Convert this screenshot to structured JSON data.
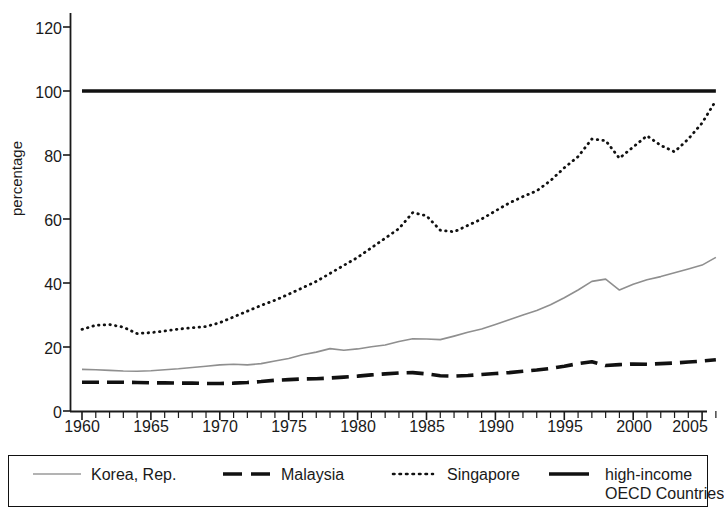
{
  "chart_data": {
    "type": "line",
    "title": "",
    "xlabel": "",
    "ylabel": "percentage",
    "xlim": [
      1960,
      2006
    ],
    "ylim": [
      0,
      120
    ],
    "ytick_values": [
      0,
      20,
      40,
      60,
      80,
      100,
      120
    ],
    "ytick_labels": [
      "0",
      "20",
      "40",
      "60",
      "80",
      "100",
      "120"
    ],
    "xtick_labels": [
      "1960",
      "1965",
      "1970",
      "1975",
      "1980",
      "1985",
      "1990",
      "1995",
      "2000",
      "2005"
    ],
    "xtick_values": [
      1960,
      1965,
      1970,
      1975,
      1980,
      1985,
      1990,
      1995,
      2000,
      2005
    ],
    "minor_xtick_step": 1,
    "grid": false,
    "legend_position": "below-plot",
    "x": [
      1960,
      1961,
      1962,
      1963,
      1964,
      1965,
      1966,
      1967,
      1968,
      1969,
      1970,
      1971,
      1972,
      1973,
      1974,
      1975,
      1976,
      1977,
      1978,
      1979,
      1980,
      1981,
      1982,
      1983,
      1984,
      1985,
      1986,
      1987,
      1988,
      1989,
      1990,
      1991,
      1992,
      1993,
      1994,
      1995,
      1996,
      1997,
      1998,
      1999,
      2000,
      2001,
      2002,
      2003,
      2004,
      2005,
      2006
    ],
    "series": [
      {
        "name": "Korea, Rep.",
        "style": "thin-solid-gray",
        "color": "#8f8f8f",
        "values": [
          13.0,
          12.9,
          12.7,
          12.5,
          12.4,
          12.6,
          12.9,
          13.2,
          13.6,
          14.0,
          14.4,
          14.6,
          14.4,
          14.8,
          15.6,
          16.4,
          17.6,
          18.4,
          19.5,
          19.0,
          19.4,
          20.1,
          20.6,
          21.7,
          22.6,
          22.5,
          22.3,
          23.4,
          24.6,
          25.6,
          27.0,
          28.5,
          30.0,
          31.4,
          33.2,
          35.4,
          37.8,
          40.5,
          41.2,
          37.8,
          39.6,
          41.0,
          42.0,
          43.2,
          44.4,
          45.6,
          48.0
        ]
      },
      {
        "name": "Malaysia",
        "style": "thick-dashed-black",
        "color": "#111111",
        "values": [
          9.0,
          9.0,
          9.0,
          9.0,
          8.9,
          8.8,
          8.8,
          8.7,
          8.7,
          8.6,
          8.6,
          8.7,
          8.9,
          9.2,
          9.6,
          9.8,
          10.0,
          10.1,
          10.3,
          10.6,
          10.9,
          11.3,
          11.6,
          11.9,
          12.0,
          11.6,
          11.0,
          10.9,
          11.1,
          11.4,
          11.7,
          12.0,
          12.4,
          12.8,
          13.3,
          14.0,
          14.8,
          15.4,
          14.2,
          14.5,
          14.7,
          14.6,
          14.8,
          15.0,
          15.3,
          15.6,
          16.0
        ]
      },
      {
        "name": "Singapore",
        "style": "dotted-black",
        "color": "#111111",
        "values": [
          25.5,
          26.8,
          27.0,
          26.2,
          24.2,
          24.5,
          25.0,
          25.6,
          26.0,
          26.4,
          27.6,
          29.4,
          31.2,
          33.0,
          34.6,
          36.5,
          38.5,
          40.5,
          43.0,
          45.5,
          48.0,
          51.0,
          54.0,
          57.0,
          62.0,
          61.0,
          56.5,
          56.0,
          58.0,
          60.0,
          62.5,
          65.0,
          67.0,
          68.8,
          72.0,
          76.0,
          79.5,
          85.0,
          84.5,
          79.0,
          82.5,
          86.0,
          83.0,
          81.0,
          85.0,
          90.0,
          97.0
        ]
      },
      {
        "name": "high-income OECD Countries",
        "style": "thick-solid-black",
        "color": "#111111",
        "values": [
          100,
          100,
          100,
          100,
          100,
          100,
          100,
          100,
          100,
          100,
          100,
          100,
          100,
          100,
          100,
          100,
          100,
          100,
          100,
          100,
          100,
          100,
          100,
          100,
          100,
          100,
          100,
          100,
          100,
          100,
          100,
          100,
          100,
          100,
          100,
          100,
          100,
          100,
          100,
          100,
          100,
          100,
          100,
          100,
          100,
          100,
          100
        ]
      }
    ]
  },
  "axis": {
    "y_label": "percentage",
    "y_ticks": [
      "0",
      "20",
      "40",
      "60",
      "80",
      "100",
      "120"
    ],
    "x_ticks": [
      "1960",
      "1965",
      "1970",
      "1975",
      "1980",
      "1985",
      "1990",
      "1995",
      "2000",
      "2005"
    ]
  },
  "legend": {
    "entries": [
      {
        "label": "Korea, Rep.",
        "label2": "",
        "sample": "thin-solid-gray-line-icon"
      },
      {
        "label": "Malaysia",
        "label2": "",
        "sample": "thick-dashed-line-icon"
      },
      {
        "label": "Singapore",
        "label2": "",
        "sample": "dotted-line-icon"
      },
      {
        "label": "high-income",
        "label2": "OECD Countries",
        "sample": "thick-solid-line-icon"
      }
    ]
  },
  "colors": {
    "korea": "#8f8f8f",
    "other_series": "#111111",
    "axis": "#1a1a1a",
    "background": "#ffffff"
  }
}
